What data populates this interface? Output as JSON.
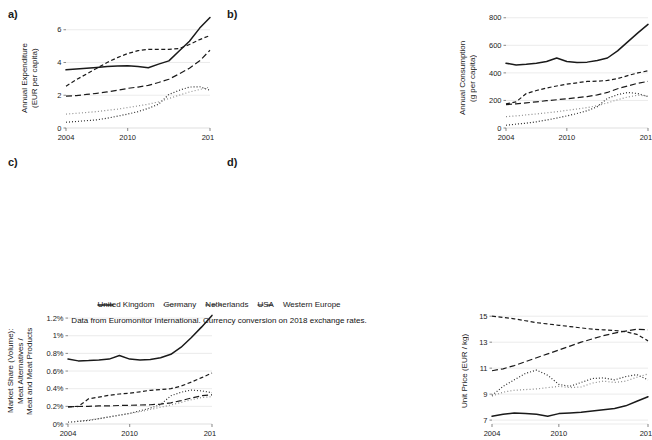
{
  "figure": {
    "caption": "Data from Euromonitor International. Currency conversion on 2018 exchange rates."
  },
  "legend": {
    "items": [
      {
        "label": "United Kingdom",
        "style": "solid",
        "dash": "none",
        "color": "#1a1a1a",
        "width": 1.5
      },
      {
        "label": "Germany",
        "style": "dotted",
        "dash": "1,2",
        "color": "#2b2b2b",
        "width": 1.2
      },
      {
        "label": "Netherlands",
        "style": "dashed",
        "dash": "4,2.5",
        "color": "#1a1a1a",
        "width": 1.2
      },
      {
        "label": "USA",
        "style": "longdash",
        "dash": "6,3",
        "color": "#1a1a1a",
        "width": 1.2
      },
      {
        "label": "Western Europe",
        "style": "fine-dotted",
        "dash": "1,2.2",
        "color": "#8c8c8c",
        "width": 1.2
      }
    ]
  },
  "panels": {
    "a": {
      "tag": "a)",
      "axis_title": "Annual Expenditure\n(EUR per capita)"
    },
    "b": {
      "tag": "b)",
      "axis_title": "Annual Consumption\n(g per capita)"
    },
    "c": {
      "tag": "c)",
      "axis_title": "Market Share (Volume):\nMeat Alternatives /\nMeat and Meat Products"
    },
    "d": {
      "tag": "d)",
      "axis_title": "Unit Price (EUR / kg)"
    }
  },
  "chart_data": [
    {
      "panel": "a",
      "type": "line",
      "title": "",
      "xlabel": "",
      "ylabel": "Annual Expenditure (EUR per capita)",
      "x": [
        2004,
        2005,
        2006,
        2007,
        2008,
        2009,
        2010,
        2011,
        2012,
        2013,
        2014,
        2015,
        2016,
        2017,
        2018
      ],
      "xticks": [
        2004,
        2010,
        2018
      ],
      "xticklabels": [
        "2004",
        "2010",
        "2018"
      ],
      "yticks": [
        0,
        2,
        4,
        6
      ],
      "yticklabels": [
        "0",
        "2",
        "4",
        "6"
      ],
      "xlim": [
        2004,
        2018
      ],
      "ylim": [
        0,
        6.9
      ],
      "grid": true,
      "legend_position": "bottom",
      "series": [
        {
          "name": "United Kingdom",
          "values": [
            3.55,
            3.6,
            3.65,
            3.7,
            3.75,
            3.78,
            3.8,
            3.75,
            3.68,
            3.9,
            4.1,
            4.7,
            5.3,
            6.1,
            6.75
          ]
        },
        {
          "name": "Germany",
          "values": [
            0.35,
            0.4,
            0.45,
            0.5,
            0.6,
            0.72,
            0.85,
            1.0,
            1.2,
            1.45,
            2.05,
            2.3,
            2.5,
            2.52,
            2.3
          ]
        },
        {
          "name": "Netherlands",
          "values": [
            2.55,
            2.95,
            3.3,
            3.65,
            4.0,
            4.3,
            4.55,
            4.72,
            4.8,
            4.8,
            4.8,
            4.85,
            5.1,
            5.4,
            5.65
          ]
        },
        {
          "name": "USA",
          "values": [
            1.95,
            1.98,
            2.05,
            2.12,
            2.2,
            2.3,
            2.42,
            2.5,
            2.6,
            2.78,
            2.98,
            3.3,
            3.65,
            4.1,
            4.75
          ]
        },
        {
          "name": "Western Europe",
          "values": [
            0.85,
            0.9,
            0.95,
            1.0,
            1.08,
            1.15,
            1.25,
            1.35,
            1.45,
            1.6,
            1.8,
            2.0,
            2.2,
            2.35,
            2.5
          ]
        }
      ]
    },
    {
      "panel": "b",
      "type": "line",
      "title": "",
      "xlabel": "",
      "ylabel": "Annual Consumption (g per capita)",
      "x": [
        2004,
        2005,
        2006,
        2007,
        2008,
        2009,
        2010,
        2011,
        2012,
        2013,
        2014,
        2015,
        2016,
        2017,
        2018
      ],
      "xticks": [
        2004,
        2010,
        2018
      ],
      "xticklabels": [
        "2004",
        "2010",
        "2018"
      ],
      "yticks": [
        0,
        200,
        400,
        600,
        800
      ],
      "yticklabels": [
        "0",
        "200",
        "400",
        "600",
        "800"
      ],
      "xlim": [
        2004,
        2018
      ],
      "ylim": [
        0,
        820
      ],
      "grid": true,
      "legend_position": "bottom",
      "series": [
        {
          "name": "United Kingdom",
          "values": [
            470,
            458,
            462,
            470,
            482,
            508,
            482,
            475,
            478,
            490,
            508,
            560,
            625,
            690,
            752
          ]
        },
        {
          "name": "Germany",
          "values": [
            20,
            28,
            35,
            45,
            58,
            72,
            88,
            105,
            125,
            155,
            215,
            242,
            258,
            250,
            228
          ]
        },
        {
          "name": "Netherlands",
          "values": [
            175,
            190,
            250,
            272,
            290,
            305,
            318,
            328,
            338,
            340,
            345,
            358,
            380,
            400,
            415
          ]
        },
        {
          "name": "USA",
          "values": [
            170,
            175,
            182,
            190,
            198,
            205,
            212,
            220,
            228,
            240,
            258,
            285,
            305,
            325,
            338
          ]
        },
        {
          "name": "Western Europe",
          "values": [
            82,
            88,
            95,
            102,
            110,
            118,
            128,
            138,
            148,
            162,
            182,
            205,
            225,
            238,
            232
          ]
        }
      ]
    },
    {
      "panel": "c",
      "type": "line",
      "title": "",
      "xlabel": "",
      "ylabel": "Market Share (Volume): Meat Alternatives / Meat and Meat Products",
      "x": [
        2004,
        2005,
        2006,
        2007,
        2008,
        2009,
        2010,
        2011,
        2012,
        2013,
        2014,
        2015,
        2016,
        2017,
        2018
      ],
      "xticks": [
        2004,
        2010,
        2018
      ],
      "xticklabels": [
        "2004",
        "2010",
        "2018"
      ],
      "yticks": [
        0,
        0.2,
        0.4,
        0.6,
        0.8,
        1.0,
        1.2
      ],
      "yticklabels": [
        "0%",
        "0.2%",
        "0.4%",
        "0.6%",
        "0.8%",
        "1%",
        "1.2%"
      ],
      "xlim": [
        2004,
        2018
      ],
      "ylim": [
        0,
        1.28
      ],
      "grid": true,
      "legend_position": "bottom",
      "series": [
        {
          "name": "United Kingdom",
          "values": [
            0.735,
            0.715,
            0.718,
            0.725,
            0.735,
            0.775,
            0.735,
            0.725,
            0.73,
            0.75,
            0.79,
            0.87,
            0.98,
            1.1,
            1.23
          ]
        },
        {
          "name": "Germany",
          "values": [
            0.02,
            0.03,
            0.04,
            0.06,
            0.08,
            0.1,
            0.12,
            0.15,
            0.18,
            0.22,
            0.32,
            0.36,
            0.385,
            0.375,
            0.355
          ]
        },
        {
          "name": "Netherlands",
          "values": [
            0.195,
            0.2,
            0.285,
            0.305,
            0.325,
            0.34,
            0.35,
            0.365,
            0.382,
            0.39,
            0.4,
            0.43,
            0.475,
            0.525,
            0.578
          ]
        },
        {
          "name": "USA",
          "values": [
            0.195,
            0.198,
            0.2,
            0.205,
            0.205,
            0.21,
            0.212,
            0.215,
            0.218,
            0.225,
            0.24,
            0.265,
            0.295,
            0.32,
            0.33
          ]
        },
        {
          "name": "Western Europe",
          "values": [
            0.02,
            0.03,
            0.045,
            0.06,
            0.08,
            0.1,
            0.12,
            0.14,
            0.165,
            0.19,
            0.215,
            0.245,
            0.275,
            0.3,
            0.31
          ]
        }
      ]
    },
    {
      "panel": "d",
      "type": "line",
      "title": "",
      "xlabel": "",
      "ylabel": "Unit Price (EUR / kg)",
      "x": [
        2004,
        2005,
        2006,
        2007,
        2008,
        2009,
        2010,
        2011,
        2012,
        2013,
        2014,
        2015,
        2016,
        2017,
        2018
      ],
      "xticks": [
        2004,
        2010,
        2018
      ],
      "xticklabels": [
        "2004",
        "2010",
        "2018"
      ],
      "yticks": [
        7,
        9,
        11,
        13,
        15
      ],
      "yticklabels": [
        "7",
        "9",
        "11",
        "13",
        "15"
      ],
      "xlim": [
        2004,
        2018
      ],
      "ylim": [
        6.7,
        15.4
      ],
      "grid": true,
      "legend_position": "bottom",
      "series": [
        {
          "name": "United Kingdom",
          "values": [
            7.3,
            7.45,
            7.55,
            7.5,
            7.45,
            7.3,
            7.5,
            7.55,
            7.6,
            7.7,
            7.8,
            7.9,
            8.1,
            8.45,
            8.8
          ]
        },
        {
          "name": "Germany",
          "values": [
            8.9,
            9.6,
            10.1,
            10.6,
            10.85,
            10.45,
            9.75,
            9.6,
            9.9,
            10.2,
            10.25,
            10.1,
            10.35,
            10.5,
            10.1
          ]
        },
        {
          "name": "Netherlands",
          "values": [
            15.0,
            14.9,
            14.8,
            14.65,
            14.5,
            14.4,
            14.3,
            14.2,
            14.1,
            14.0,
            13.95,
            13.9,
            13.8,
            13.6,
            13.1
          ]
        },
        {
          "name": "USA",
          "values": [
            10.8,
            10.95,
            11.2,
            11.5,
            11.8,
            12.1,
            12.4,
            12.7,
            13.0,
            13.25,
            13.5,
            13.7,
            13.85,
            14.0,
            13.95
          ]
        },
        {
          "name": "Western Europe",
          "values": [
            8.85,
            9.15,
            9.3,
            9.35,
            9.4,
            9.5,
            9.6,
            9.5,
            9.55,
            9.85,
            10.0,
            9.9,
            10.0,
            10.3,
            10.55
          ]
        }
      ]
    }
  ]
}
